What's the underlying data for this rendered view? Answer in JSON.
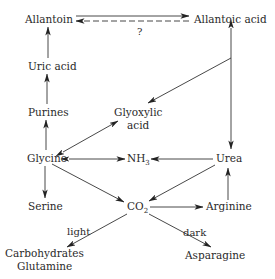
{
  "diagram": {
    "nodes": {
      "allantoin": "Allantoin",
      "allantoic_acid": "Allantoic acid",
      "uric_acid": "Uric acid",
      "purines": "Purines",
      "glyoxylic_acid_line1": "Glyoxylic",
      "glyoxylic_acid_line2": "acid",
      "glycine": "Glycine",
      "nh3": "NH",
      "nh3_sub": "3",
      "urea": "Urea",
      "serine": "Serine",
      "co2": "CO",
      "co2_sub": "2",
      "arginine": "Arginine",
      "carbohydrates": "Carbohydrates",
      "glutamine": "Glutamine",
      "asparagine": "Asparagine"
    },
    "edge_labels": {
      "unknown": "?",
      "light": "light",
      "dark": "dark"
    },
    "edges": [
      {
        "from": "Allantoin",
        "to": "Allantoic acid",
        "style": "solid"
      },
      {
        "from": "Allantoic acid",
        "to": "Allantoin",
        "style": "dashed",
        "label": "?"
      },
      {
        "from": "Uric acid",
        "to": "Allantoin",
        "style": "solid"
      },
      {
        "from": "Purines",
        "to": "Uric acid",
        "style": "solid"
      },
      {
        "from": "Glycine",
        "to": "Purines",
        "style": "solid"
      },
      {
        "from": "Glycine",
        "to": "Glyoxylic acid",
        "style": "solid",
        "bidirectional": true
      },
      {
        "from": "Allantoic acid",
        "to": "Glyoxylic acid",
        "style": "solid"
      },
      {
        "from": "Urea",
        "to": "Allantoic acid",
        "style": "solid",
        "bidirectional": true
      },
      {
        "from": "Glycine",
        "to": "NH3",
        "style": "solid",
        "bidirectional": true
      },
      {
        "from": "Urea",
        "to": "NH3",
        "style": "solid"
      },
      {
        "from": "Glycine",
        "to": "Serine",
        "style": "solid"
      },
      {
        "from": "Glycine",
        "to": "CO2",
        "style": "solid"
      },
      {
        "from": "Urea",
        "to": "CO2",
        "style": "solid"
      },
      {
        "from": "CO2",
        "to": "Arginine",
        "style": "solid"
      },
      {
        "from": "Arginine",
        "to": "Urea",
        "style": "solid"
      },
      {
        "from": "CO2",
        "to": "Carbohydrates Glutamine",
        "style": "solid",
        "label": "light"
      },
      {
        "from": "CO2",
        "to": "Asparagine",
        "style": "solid",
        "label": "dark"
      }
    ]
  }
}
